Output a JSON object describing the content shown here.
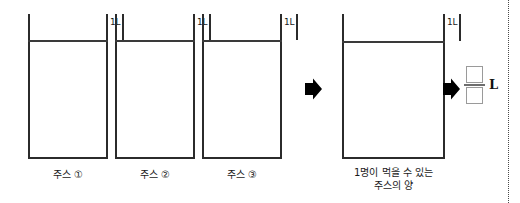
{
  "figure": {
    "unit_label": "1L",
    "colors": {
      "stroke": "#2b2b2b",
      "juice_line": "#3a3a3a",
      "arrow": "#000000",
      "box_border": "#9a9a9a",
      "margin_rule": "#4a4a4a",
      "background": "#ffffff"
    },
    "containers": [
      {
        "id": "juice-1",
        "caption": "주스 ①",
        "unit_label": "1L",
        "x": 28,
        "width": 80,
        "top": 14,
        "bottom": 157,
        "level": 40
      },
      {
        "id": "juice-2",
        "caption": "주스 ②",
        "unit_label": "1L",
        "x": 115,
        "width": 80,
        "top": 14,
        "bottom": 157,
        "level": 40
      },
      {
        "id": "juice-3",
        "caption": "주스 ③",
        "unit_label": "1L",
        "x": 202,
        "width": 80,
        "top": 14,
        "bottom": 157,
        "level": 40
      },
      {
        "id": "juice-per-person",
        "caption_line1": "1명이 먹을 수 있는",
        "caption_line2": "주스의 양",
        "unit_label": "1L",
        "x": 342,
        "width": 103,
        "top": 14,
        "bottom": 157,
        "level": 41
      }
    ],
    "arrows": [
      {
        "id": "arrow-to-result",
        "x": 303,
        "y": 78
      },
      {
        "id": "arrow-to-answer",
        "x": 441,
        "y": 78
      }
    ],
    "answer": {
      "numerator": "",
      "denominator": "",
      "unit": "L"
    },
    "margin_rule_x": 508
  }
}
